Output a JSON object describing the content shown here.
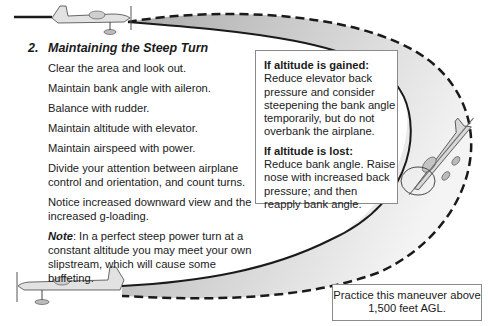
{
  "section": {
    "number": "2.",
    "title": "Maintaining the Steep Turn"
  },
  "steps": [
    "Clear the area and look out.",
    "Maintain bank angle with aileron.",
    "Balance with rudder.",
    "Maintain altitude with elevator.",
    "Maintain airspeed with power.",
    "Divide your attention between airplane control and orientation, and count turns.",
    "Notice increased downward view and the increased g-loading."
  ],
  "note": {
    "label": "Note",
    "text": ": In a perfect steep power turn at a constant altitude you may meet your own slipstream, which will cause some buffeting."
  },
  "corrections": {
    "gained": {
      "title": "If altitude is gained:",
      "text": "Reduce elevator back pressure and consider steepening the bank angle temporarily, but do not overbank the airplane."
    },
    "lost": {
      "title": "If altitude is lost:",
      "text": "Reduce bank angle. Raise nose with increased back pressure; and then reapply bank angle."
    }
  },
  "practice_note": "Practice this maneuver above 1,500 feet AGL.",
  "colors": {
    "swath_light": "#f2f2f2",
    "swath_dark": "#a8a8a8",
    "line": "#1a1a1a",
    "box_border": "#8a8a8a"
  }
}
